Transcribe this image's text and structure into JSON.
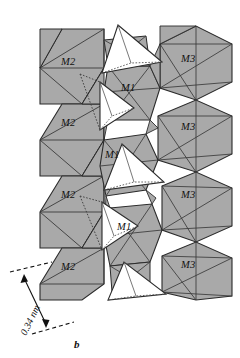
{
  "figure": {
    "panel_label": "b",
    "type": "crystal-structure-polyhedral-diagram",
    "site_labels": [
      {
        "text": "M2",
        "x": 68,
        "y": 63
      },
      {
        "text": "M3",
        "x": 188,
        "y": 60
      },
      {
        "text": "M1",
        "x": 128,
        "y": 89
      },
      {
        "text": "M2",
        "x": 68,
        "y": 124
      },
      {
        "text": "M3",
        "x": 188,
        "y": 128
      },
      {
        "text": "M1",
        "x": 112,
        "y": 156
      },
      {
        "text": "M2",
        "x": 68,
        "y": 196
      },
      {
        "text": "M3",
        "x": 188,
        "y": 196
      },
      {
        "text": "M1",
        "x": 124,
        "y": 228
      },
      {
        "text": "M2",
        "x": 68,
        "y": 268
      },
      {
        "text": "M3",
        "x": 188,
        "y": 266
      }
    ],
    "scale_bar": {
      "value": "0.34 nm",
      "arrow_from": {
        "x": 24,
        "y": 277
      },
      "arrow_to": {
        "x": 46,
        "y": 325
      },
      "guide_top": {
        "x1": 10,
        "y1": 272,
        "x2": 52,
        "y2": 262
      },
      "guide_bottom": {
        "x1": 32,
        "y1": 334,
        "x2": 74,
        "y2": 322
      },
      "text_x": 18,
      "text_y": 330
    },
    "colors": {
      "octahedron_fill": "#a9a9a9",
      "tetrahedron_fill": "#ffffff",
      "edge_stroke": "#2b2b2b",
      "inner_stroke": "#3a3a3a",
      "dotted_stroke": "#555555",
      "background": "#ffffff",
      "label_color": "#111111"
    },
    "legend_note": "",
    "octahedra_label_groups": [
      "M1",
      "M2",
      "M3"
    ]
  }
}
